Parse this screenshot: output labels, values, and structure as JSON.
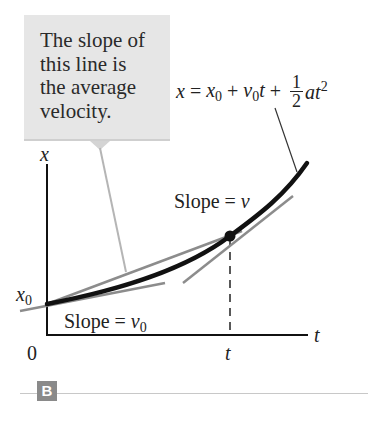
{
  "callout": {
    "text": "The slope of\nthis line is\nthe average\nvelocity."
  },
  "equation": {
    "lhs": "x",
    "eq": " = ",
    "x0_base": "x",
    "x0_sub": "0",
    "plus1": " + ",
    "v0_base": "v",
    "v0_sub": "0",
    "t": "t",
    "plus2": " + ",
    "frac_num": "1",
    "frac_den": "2",
    "at": "at",
    "exp": "2"
  },
  "axes": {
    "y_label": "x",
    "x_label": "t",
    "origin_label": "0",
    "x0_base": "x",
    "x0_sub": "0",
    "t_tick_label": "t"
  },
  "annotations": {
    "slope_v_text": "Slope = ",
    "slope_v_var": "v",
    "slope_v0_text": "Slope = ",
    "slope_v0_base": "v",
    "slope_v0_sub": "0"
  },
  "panel": {
    "badge": "B"
  },
  "colors": {
    "callout_bg": "#e6e6e6",
    "curve": "#111111",
    "tangent": "#8c8c8c",
    "leader": "#b5b5b5",
    "badge_bg": "#8a8a8a"
  }
}
